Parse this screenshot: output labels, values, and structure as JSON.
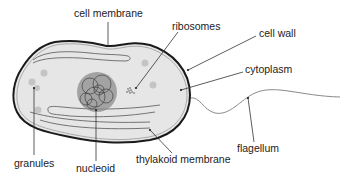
{
  "diagram": {
    "labels": {
      "cell_membrane": "cell membrane",
      "ribosomes": "ribosomes",
      "cell_wall": "cell wall",
      "cytoplasm": "cytoplasm",
      "granules": "granules",
      "nucleoid": "nucleoid",
      "thylakoid_membrane": "thylakoid membrane",
      "flagellum": "flagellum"
    },
    "colors": {
      "cell_fill": "#e6e6e6",
      "cell_wall": "#1a1a1a",
      "granule": "#c4c4c4",
      "nucleoid_fill": "#8c8c8c",
      "line": "#333333",
      "text": "#222222"
    }
  }
}
